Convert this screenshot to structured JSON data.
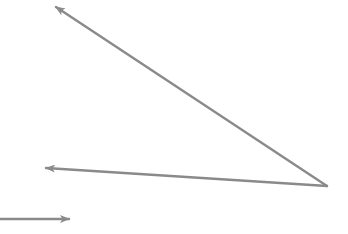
{
  "diagram": {
    "background": "#ffffff",
    "stroke_color": "#8a8a8a",
    "stroke_width": 2.4,
    "arrows": [
      {
        "name": "arrow-upper-left",
        "from": [
          327,
          186
        ],
        "to": [
          56,
          7
        ]
      },
      {
        "name": "arrow-middle-left",
        "from": [
          327,
          186
        ],
        "to": [
          46,
          168
        ]
      },
      {
        "name": "arrow-bottom-right",
        "from": [
          0,
          219
        ],
        "to": [
          69,
          219
        ]
      }
    ]
  }
}
